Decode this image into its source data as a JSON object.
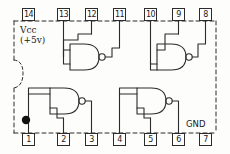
{
  "diagram": {
    "package": "14-pin DIP",
    "outline_style": "dashed",
    "ink_color": "#2b2b2b",
    "background_color": "#fdfdfc"
  },
  "labels": {
    "vcc": "Vcc\n(+5v)",
    "gnd": "GND"
  },
  "pin_marker": {
    "name": "pin-1-dot",
    "shape": "filled-circle",
    "color": "#111111"
  },
  "pins": [
    {
      "number": "14",
      "x": 22,
      "y": 8,
      "side": "top",
      "role": "Vcc"
    },
    {
      "number": "13",
      "x": 57,
      "y": 8,
      "side": "top",
      "role": "input"
    },
    {
      "number": "12",
      "x": 85,
      "y": 8,
      "side": "top",
      "role": "input"
    },
    {
      "number": "11",
      "x": 113,
      "y": 8,
      "side": "top",
      "role": "output"
    },
    {
      "number": "10",
      "x": 144,
      "y": 8,
      "side": "top",
      "role": "input"
    },
    {
      "number": "9",
      "x": 172,
      "y": 8,
      "side": "top",
      "role": "input"
    },
    {
      "number": "8",
      "x": 199,
      "y": 8,
      "side": "top",
      "role": "output"
    },
    {
      "number": "7",
      "x": 199,
      "y": 133,
      "side": "bottom",
      "role": "GND"
    },
    {
      "number": "6",
      "x": 172,
      "y": 133,
      "side": "bottom",
      "role": "output"
    },
    {
      "number": "5",
      "x": 144,
      "y": 133,
      "side": "bottom",
      "role": "input"
    },
    {
      "number": "4",
      "x": 113,
      "y": 133,
      "side": "bottom",
      "role": "input"
    },
    {
      "number": "3",
      "x": 85,
      "y": 133,
      "side": "bottom",
      "role": "output"
    },
    {
      "number": "2",
      "x": 57,
      "y": 133,
      "side": "bottom",
      "role": "input"
    },
    {
      "number": "1",
      "x": 22,
      "y": 133,
      "side": "bottom",
      "role": "input"
    }
  ],
  "gates": [
    {
      "id": "gate-top-left",
      "type": "NAND",
      "inputs": [
        "13",
        "12"
      ],
      "output": "11"
    },
    {
      "id": "gate-top-right",
      "type": "NAND",
      "inputs": [
        "9",
        "10"
      ],
      "output": "8"
    },
    {
      "id": "gate-bottom-left",
      "type": "NAND",
      "inputs": [
        "1",
        "2"
      ],
      "output": "3"
    },
    {
      "id": "gate-bottom-right",
      "type": "NAND",
      "inputs": [
        "4",
        "5"
      ],
      "output": "6"
    }
  ]
}
